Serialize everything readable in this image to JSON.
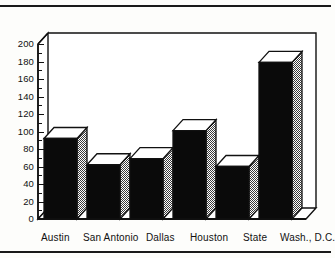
{
  "chart_data": {
    "type": "bar",
    "title": "",
    "subtitle": "",
    "xlabel": "",
    "ylabel": "",
    "categories": [
      "Austin",
      "San Antonio",
      "Dallas",
      "Houston",
      "State",
      "Wash., D.C."
    ],
    "values": [
      92,
      62,
      69,
      101,
      60,
      179
    ],
    "series": [
      {
        "name": "",
        "values": [
          92,
          62,
          69,
          101,
          60,
          179
        ]
      }
    ],
    "ylim": [
      0,
      200
    ],
    "ytick_labels": [
      "0",
      "20",
      "40",
      "60",
      "80",
      "100",
      "120",
      "140",
      "160",
      "180",
      "200"
    ],
    "ytick_values": [
      0,
      20,
      40,
      60,
      80,
      100,
      120,
      140,
      160,
      180,
      200
    ],
    "ytick_step": 20,
    "minor_tick_step": 10,
    "grid": false,
    "legend": false,
    "legend_position": "none",
    "style": "3d-bar",
    "annotations": []
  },
  "colors": {
    "ink": "#111111",
    "bar_front": "#0a0a0a",
    "bar_top": "#ffffff",
    "bar_side": "#9b9b9b",
    "plot_background": "#ffffff",
    "page_background": "#fdfdfb"
  },
  "rules": {
    "top_divider": "",
    "bottom_divider": ""
  }
}
